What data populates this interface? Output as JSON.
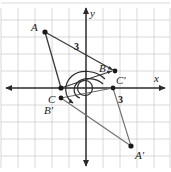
{
  "figure": {
    "background_color": "#ffffff",
    "width": 171,
    "height": 172
  },
  "grid": {
    "spacing_px": 17,
    "color": "#c8c8c8",
    "visible": true
  },
  "axes": {
    "origin_px": {
      "x": 86,
      "y": 88
    },
    "color": "#2b2b2b",
    "x_axis": {
      "label": "x",
      "label_px": {
        "x": 157,
        "y": 79
      },
      "double_arrow": true
    },
    "y_axis": {
      "label": "y",
      "label_px": {
        "x": 92,
        "y": 14
      },
      "double_arrow": true
    }
  },
  "points": [
    {
      "name": "A",
      "label": "A",
      "px": {
        "x": 45,
        "y": 32
      },
      "label_px": {
        "x": 34,
        "y": 27
      }
    },
    {
      "name": "B",
      "label": "B",
      "px": {
        "x": 115,
        "y": 71
      },
      "label_px": {
        "x": 100,
        "y": 68
      }
    },
    {
      "name": "C",
      "label": "C",
      "px": {
        "x": 61,
        "y": 88
      },
      "label_px": {
        "x": 49,
        "y": 100
      }
    },
    {
      "name": "Cp",
      "label": "C′",
      "px": {
        "x": 113,
        "y": 71
      },
      "label_px": {
        "x": 117,
        "y": 82
      }
    },
    {
      "name": "Bp",
      "label": "B′",
      "px": {
        "x": 61,
        "y": 98
      },
      "label_px": {
        "x": 46,
        "y": 111
      }
    },
    {
      "name": "Ap",
      "label": "A′",
      "px": {
        "x": 131,
        "y": 146
      },
      "label_px": {
        "x": 136,
        "y": 157
      }
    },
    {
      "name": "Cp2",
      "label": "",
      "px": {
        "x": 113,
        "y": 88
      },
      "label_px": {
        "x": 0,
        "y": 0
      }
    }
  ],
  "segment_labels": [
    {
      "text": "3",
      "px": {
        "x": 76,
        "y": 47
      },
      "note": "length of A to B"
    },
    {
      "text": "3",
      "px": {
        "x": 120,
        "y": 101
      },
      "note": "length of C-prime to A-prime side"
    }
  ],
  "triangles": [
    {
      "name": "original",
      "vertices": [
        "A",
        "B",
        "C"
      ],
      "stroke": "#3a3a3a"
    },
    {
      "name": "image",
      "vertices": [
        "Ap",
        "Bp",
        "Cp2"
      ],
      "stroke": "#6b6b6b"
    }
  ],
  "rotation_arc": {
    "center_px": {
      "x": 85,
      "y": 88
    },
    "direction": "clockwise",
    "arrow_at_px": {
      "x": 78,
      "y": 103
    },
    "color": "#2b2b2b",
    "spiral_turns": 1.6
  },
  "point_marker": {
    "radius_px": 2.4,
    "fill": "#1a1a1a"
  }
}
